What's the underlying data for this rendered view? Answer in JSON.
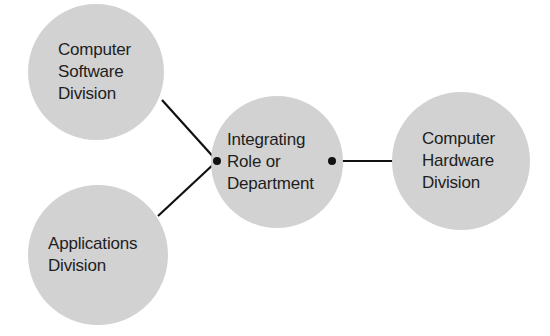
{
  "diagram": {
    "type": "hub-and-spoke organizational diagram",
    "colors": {
      "node_fill": "#d2d2d2",
      "line": "#111111",
      "text": "#1e1e1e",
      "background": "#ffffff"
    },
    "nodes": [
      {
        "id": "software",
        "label": "Computer\nSoftware\nDivision"
      },
      {
        "id": "applications",
        "label": "Applications\nDivision"
      },
      {
        "id": "integrating",
        "label": "Integrating\nRole or\nDepartment"
      },
      {
        "id": "hardware",
        "label": "Computer\nHardware\nDivision"
      }
    ],
    "edges": [
      {
        "from": "software",
        "to": "integrating"
      },
      {
        "from": "applications",
        "to": "integrating"
      },
      {
        "from": "integrating",
        "to": "hardware"
      }
    ]
  }
}
